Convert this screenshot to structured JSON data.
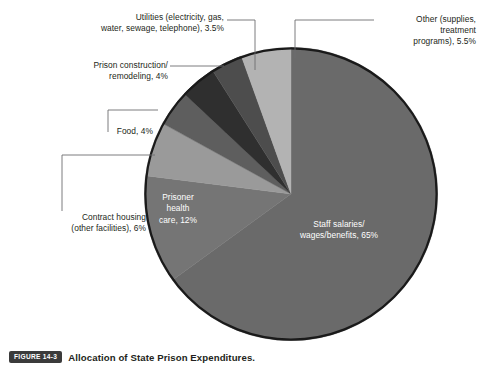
{
  "figure": {
    "badge": "FIGURE 14-3",
    "caption": "Allocation of State Prison Expenditures."
  },
  "colors": {
    "background": "#ffffff",
    "outline": "#1a1a1a",
    "leader_line": "#6d6e71",
    "text": "#231f20",
    "inner_text": "#ffffff",
    "badge_bg": "#3b3b3b"
  },
  "labels": {
    "utilities": "Utilities (electricity, gas,\nwater, sewage, telephone), 3.5%",
    "other": "Other (supplies,\ntreatment\nprograms), 5.5%",
    "construction": "Prison construction/\nremodeling, 4%",
    "food": "Food, 4%",
    "contract": "Contract housing\n(other facilities), 6%",
    "health": "Prisoner\nhealth\ncare, 12%",
    "staff": "Staff salaries/\nwages/benefits, 65%"
  },
  "chart_data": {
    "type": "pie",
    "title": "Allocation of State Prison Expenditures.",
    "unit": "percent",
    "total": 100,
    "start_angle": 0,
    "direction": "clockwise",
    "legend": "none-labeled-directly",
    "categories": [
      "Staff salaries/wages/benefits",
      "Prisoner health care",
      "Contract housing (other facilities)",
      "Food",
      "Prison construction/remodeling",
      "Utilities (electricity, gas, water, sewage, telephone)",
      "Other (supplies, treatment programs)"
    ],
    "values": [
      65,
      12,
      6,
      4,
      4,
      3.5,
      5.5
    ],
    "slices": [
      {
        "name": "Staff salaries/wages/benefits",
        "label": "Staff salaries/\nwages/benefits, 65%",
        "value": 65,
        "color": "#6a6a6a",
        "label_placement": "inside",
        "label_color": "#ffffff"
      },
      {
        "name": "Prisoner health care",
        "label": "Prisoner\nhealth\ncare, 12%",
        "value": 12,
        "color": "#757575",
        "label_placement": "inside",
        "label_color": "#ffffff"
      },
      {
        "name": "Contract housing (other facilities)",
        "label": "Contract housing\n(other facilities), 6%",
        "value": 6,
        "color": "#9a9a9a",
        "label_placement": "outside-left",
        "label_color": "#231f20"
      },
      {
        "name": "Food",
        "label": "Food, 4%",
        "value": 4,
        "color": "#5e5e5e",
        "label_placement": "outside-left",
        "label_color": "#231f20"
      },
      {
        "name": "Prison construction/remodeling",
        "label": "Prison construction/\nremodeling, 4%",
        "value": 4,
        "color": "#2f2f2f",
        "label_placement": "outside-left",
        "label_color": "#231f20"
      },
      {
        "name": "Utilities (electricity, gas, water, sewage, telephone)",
        "label": "Utilities (electricity, gas,\nwater, sewage, telephone), 3.5%",
        "value": 3.5,
        "color": "#4d4d4d",
        "label_placement": "outside-top",
        "label_color": "#231f20"
      },
      {
        "name": "Other (supplies, treatment programs)",
        "label": "Other (supplies,\ntreatment\nprograms), 5.5%",
        "value": 5.5,
        "color": "#b3b3b3",
        "label_placement": "outside-right",
        "label_color": "#231f20"
      }
    ]
  }
}
